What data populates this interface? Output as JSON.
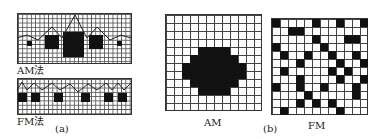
{
  "panel_a": {
    "label": "(a)",
    "am": {
      "label": "AM法",
      "dots": [
        {
          "x": 27,
          "y": 41,
          "w": 5,
          "h": 5
        },
        {
          "x": 45,
          "y": 35,
          "w": 14,
          "h": 14
        },
        {
          "x": 63,
          "y": 32,
          "w": 21,
          "h": 25
        },
        {
          "x": 89,
          "y": 35,
          "w": 14,
          "h": 14
        },
        {
          "x": 117,
          "y": 41,
          "w": 5,
          "h": 5
        }
      ],
      "curve": "M17,38 L27,35 L38,40 L52,27 L62,38 L75,15 L87,38 L97,27 L110,40 L121,35 L131,38"
    },
    "fm": {
      "label": "FM法",
      "dots": [
        {
          "x": 18,
          "y": 93,
          "w": 9,
          "h": 9
        },
        {
          "x": 31,
          "y": 93,
          "w": 9,
          "h": 9
        },
        {
          "x": 54,
          "y": 93,
          "w": 9,
          "h": 9
        },
        {
          "x": 81,
          "y": 93,
          "w": 9,
          "h": 9
        },
        {
          "x": 104,
          "y": 93,
          "w": 9,
          "h": 9
        },
        {
          "x": 118,
          "y": 93,
          "w": 9,
          "h": 9
        }
      ],
      "curve": "M17,90 L22,82 L27,90 L34,83 L42,90 L52,83 L60,90 L70,84 L78,92 L88,84 L97,90 L106,83 L112,90 L118,83 L124,90 L131,83"
    }
  },
  "panel_b": {
    "label": "(b)",
    "am": {
      "label": "AM",
      "rows": 12,
      "cols": 12,
      "filled": [
        [
          4,
          4
        ],
        [
          4,
          5
        ],
        [
          4,
          6
        ],
        [
          4,
          7
        ],
        [
          5,
          3
        ],
        [
          5,
          4
        ],
        [
          5,
          5
        ],
        [
          5,
          6
        ],
        [
          5,
          7
        ],
        [
          5,
          8
        ],
        [
          6,
          2
        ],
        [
          6,
          3
        ],
        [
          6,
          4
        ],
        [
          6,
          5
        ],
        [
          6,
          6
        ],
        [
          6,
          7
        ],
        [
          6,
          8
        ],
        [
          6,
          9
        ],
        [
          7,
          2
        ],
        [
          7,
          3
        ],
        [
          7,
          4
        ],
        [
          7,
          5
        ],
        [
          7,
          6
        ],
        [
          7,
          7
        ],
        [
          7,
          8
        ],
        [
          7,
          9
        ],
        [
          8,
          3
        ],
        [
          8,
          4
        ],
        [
          8,
          5
        ],
        [
          8,
          6
        ],
        [
          8,
          7
        ],
        [
          8,
          8
        ],
        [
          9,
          4
        ],
        [
          9,
          5
        ],
        [
          9,
          6
        ],
        [
          9,
          7
        ]
      ]
    },
    "fm": {
      "label": "FM",
      "rows": 12,
      "cols": 12,
      "filled": [
        [
          0,
          0
        ],
        [
          0,
          5
        ],
        [
          0,
          8
        ],
        [
          0,
          11
        ],
        [
          1,
          2
        ],
        [
          1,
          3
        ],
        [
          2,
          5
        ],
        [
          2,
          9
        ],
        [
          2,
          10
        ],
        [
          3,
          0
        ],
        [
          3,
          6
        ],
        [
          4,
          1
        ],
        [
          4,
          4
        ],
        [
          4,
          7
        ],
        [
          4,
          10
        ],
        [
          5,
          3
        ],
        [
          5,
          8
        ],
        [
          5,
          11
        ],
        [
          6,
          1
        ],
        [
          6,
          7
        ],
        [
          6,
          9
        ],
        [
          7,
          3
        ],
        [
          7,
          8
        ],
        [
          7,
          11
        ],
        [
          8,
          0
        ],
        [
          8,
          3
        ],
        [
          8,
          6
        ],
        [
          8,
          10
        ],
        [
          9,
          4
        ],
        [
          9,
          10
        ],
        [
          10,
          3
        ],
        [
          10,
          5
        ],
        [
          10,
          7
        ],
        [
          11,
          1
        ],
        [
          11,
          8
        ]
      ]
    }
  }
}
